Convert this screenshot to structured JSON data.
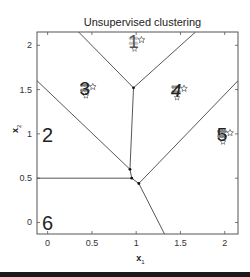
{
  "chart_data": {
    "type": "scatter",
    "title": "Unsupervised clustering",
    "xlabel": "x1",
    "ylabel": "x2",
    "xlim": [
      -0.12,
      2.15
    ],
    "ylim": [
      -0.13,
      2.15
    ],
    "xticks": [
      0,
      0.5,
      1,
      1.5,
      2
    ],
    "yticks": [
      0,
      0.5,
      1,
      1.5,
      2
    ],
    "xtick_labels": [
      "0",
      "0.5",
      "1",
      "1.5",
      "2"
    ],
    "ytick_labels": [
      "0",
      "0.5",
      "1",
      "1.5",
      "2"
    ],
    "grid": false,
    "legend": null,
    "clusters": [
      {
        "label": "1",
        "x": 0.97,
        "y": 2.05,
        "color": "#a0a0a0"
      },
      {
        "label": "2",
        "x": 0.0,
        "y": 1.0,
        "color": "#222222"
      },
      {
        "label": "3",
        "x": 0.42,
        "y": 1.52,
        "color": "#333333"
      },
      {
        "label": "4",
        "x": 1.45,
        "y": 1.5,
        "color": "#444444"
      },
      {
        "label": "5",
        "x": 1.97,
        "y": 1.0,
        "color": "#333333"
      },
      {
        "label": "6",
        "x": 0.0,
        "y": 0.0,
        "color": "#222222"
      }
    ],
    "boundary_vertices": [
      {
        "x": 0.97,
        "y": 1.52
      },
      {
        "x": 0.93,
        "y": 0.6
      },
      {
        "x": 0.95,
        "y": 0.5
      },
      {
        "x": 1.03,
        "y": 0.44
      }
    ],
    "boundary_segments": [
      [
        [
          0.35,
          2.15
        ],
        [
          0.97,
          1.52
        ]
      ],
      [
        [
          1.67,
          2.15
        ],
        [
          0.97,
          1.52
        ]
      ],
      [
        [
          0.97,
          1.52
        ],
        [
          0.93,
          0.6
        ]
      ],
      [
        [
          -0.12,
          1.6
        ],
        [
          0.93,
          0.6
        ]
      ],
      [
        [
          0.93,
          0.6
        ],
        [
          0.95,
          0.5
        ]
      ],
      [
        [
          -0.12,
          0.5
        ],
        [
          0.95,
          0.5
        ]
      ],
      [
        [
          0.95,
          0.5
        ],
        [
          1.03,
          0.44
        ]
      ],
      [
        [
          2.15,
          1.6
        ],
        [
          1.03,
          0.44
        ]
      ],
      [
        [
          1.03,
          0.44
        ],
        [
          1.32,
          -0.13
        ]
      ]
    ]
  }
}
